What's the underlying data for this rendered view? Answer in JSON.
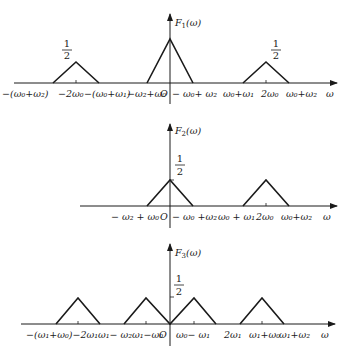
{
  "panels": [
    {
      "id": "F1",
      "ylabel": "F₁(ω)",
      "xlabel": "ω",
      "origin_label": "O",
      "height_label_num": "1",
      "height_label_den": "2",
      "triangles": [
        {
          "center": "-2ω₀",
          "left": "-(ω₀+ω₂)",
          "right": "-(ω₀+ω₁)",
          "height": 0.5
        },
        {
          "center": "0",
          "left": "-ω₂+ω₀",
          "right": "-ω₀+ω₂",
          "height": 1
        },
        {
          "center": "2ω₀",
          "left": "ω₀+ω₁",
          "right": "ω₀+ω₂",
          "height": 0.5
        }
      ],
      "tick_labels": [
        "-(ω₀+ω₂)",
        "-2ω₀",
        "-(ω₀+ω₁)",
        "-ω₂+ω₀",
        "O",
        "-ω₀+ω₂",
        "ω₀+ω₁",
        "2ω₀",
        "ω₀+ω₂"
      ]
    },
    {
      "id": "F2",
      "ylabel": "F₂(ω)",
      "xlabel": "ω",
      "origin_label": "O",
      "height_label_num": "1",
      "height_label_den": "2",
      "triangles": [
        {
          "center": "0",
          "left": "-ω₂+ω₀",
          "right": "-ω₀+ω₂",
          "height": 0.5
        },
        {
          "center": "2ω₀",
          "left": "ω₀+ω₁",
          "right": "ω₀+ω₂",
          "height": 0.5
        }
      ],
      "tick_labels": [
        "-ω₂+ω₀",
        "O",
        "-ω₀+ω₂",
        "ω₀+ω₁",
        "2ω₀",
        "ω₀+ω₂"
      ]
    },
    {
      "id": "F3",
      "ylabel": "F₃(ω)",
      "xlabel": "ω",
      "origin_label": "O",
      "height_label_num": "1",
      "height_label_den": "2",
      "triangles": [
        {
          "center": "-2ω₁",
          "height": 0.5
        },
        {
          "center": "ω₁-ω₀",
          "height": 0.5
        },
        {
          "center": "ω₀-ω₁",
          "height": 0.5
        },
        {
          "center": "ω₁+ω₀",
          "height": 0.5
        }
      ],
      "tick_labels": [
        "-(ω₁+ω₀)",
        "-2ω₁",
        "ω₁-ω₂",
        "ω₁-ω₀",
        "O",
        "ω₀-ω₁",
        "2ω₁",
        "ω₁+ω₀",
        "ω₁+ω₂"
      ]
    }
  ],
  "labels": {
    "p1": {
      "ylabel": "F",
      "ysub": "1",
      "yarg": "(ω)",
      "xlabel": "ω",
      "origin": "O",
      "t_neg_w0w2": "−(ω₀+ω₂)",
      "t_neg_2w0": "−2ω₀",
      "t_neg_w0w1": "−(ω₀+ω₁)",
      "t_neg_w2_w0": "−ω₂+ω₀",
      "t_neg_w0_w2": "− ω₀+ ω₂",
      "t_w0w1": "ω₀+ω₁",
      "t_2w0": "2ω₀",
      "t_w0w2": "ω₀+ω₂",
      "half_num": "1",
      "half_den": "2"
    },
    "p2": {
      "ylabel": "F",
      "ysub": "2",
      "yarg": "(ω)",
      "xlabel": "ω",
      "origin": "O",
      "t_neg_w2_w0": "− ω₂ + ω₀",
      "t_neg_w0_w2": "− ω₀ +ω₂",
      "t_w0w1": "ω₀ + ω₁",
      "t_2w0": "2ω₀",
      "t_w0w2": "ω₀+ω₂",
      "half_num": "1",
      "half_den": "2"
    },
    "p3": {
      "ylabel": "F",
      "ysub": "3",
      "yarg": "(ω)",
      "xlabel": "ω",
      "origin": "O",
      "t_neg_w1w0_2w1": "−(ω₁+ω₀)−2ω₁",
      "t_w1_w2": "ω₁− ω₂",
      "t_w1_w0": "ω₁−ω₀",
      "t_w0_w1": "ω₀− ω₁",
      "t_2w1": "2ω₁",
      "t_w1w0": "ω₁+ω₀",
      "t_w1w2": "ω₁+ω₂",
      "half_num": "1",
      "half_den": "2"
    }
  }
}
